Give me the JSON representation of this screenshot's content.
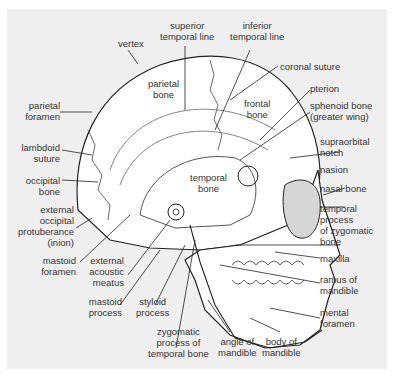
{
  "diagram": {
    "colors": {
      "background": "#efefef",
      "bone": "#ffffff",
      "line": "#222222",
      "orbit_shade": "#d6d6d6",
      "text": "#333333"
    },
    "labels": {
      "vertex": "vertex",
      "superior_temporal_line": "superior\ntemporal line",
      "inferior_temporal_line": "inferior\ntemporal line",
      "parietal_bone": "parietal\nbone",
      "coronal_suture": "coronal suture",
      "frontal_bone": "frontal\nbone",
      "pterion": "pterion",
      "sphenoid_bone": "sphenoid bone\n(greater wing)",
      "parietal_foramen": "parietal\nforamen",
      "lambdoid_suture": "lambdoid\nsuture",
      "occipital_bone": "occipital\nbone",
      "temporal_bone": "temporal\nbone",
      "supraorbital_notch": "supraorbital\nnotch",
      "nasion": "nasion",
      "nasal_bone": "nasal bone",
      "external_occipital_protuberance": "external\noccipital\nprotuberance\n(inion)",
      "temporal_process_zygomatic": "temporal\nprocess\nof zygomatic\nbone",
      "mastoid_foramen": "mastoid\nforamen",
      "external_acoustic_meatus": "external\nacoustic\nmeatus",
      "maxilla": "maxilla",
      "ramus_of_mandible": "ramus of\nmandible",
      "mastoid_process": "mastoid\nprocess",
      "styloid_process": "styloid\nprocess",
      "mental_foramen": "mental\nforamen",
      "zygomatic_process_temporal": "zygomatic\nprocess of\ntemporal bone",
      "angle_of_mandible": "angle of\nmandible",
      "body_of_mandible": "body of\nmandible"
    }
  }
}
